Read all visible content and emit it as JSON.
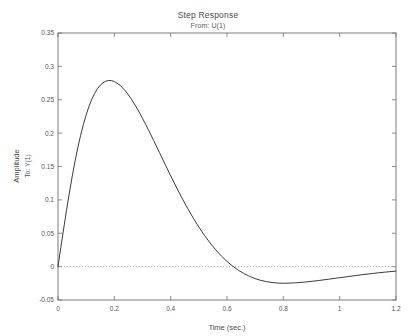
{
  "figure": {
    "title": "Step Response",
    "subtitle": "From: U(1)",
    "background_color": "#ffffff",
    "curve_color": "#3b3b3b",
    "axis_color": "#6f6f6f",
    "zero_line_color": "#9a9a9a"
  },
  "axes": {
    "xlabel": "Time (sec.)",
    "ylabel": "Amplitude",
    "ylabel_sub": "To: Y(1)"
  },
  "chart_data": {
    "type": "line",
    "title": "Step Response",
    "subtitle": "From: U(1)",
    "xlabel": "Time (sec.)",
    "ylabel": "Amplitude",
    "ylabel_sub": "To: Y(1)",
    "xlim": [
      0,
      1.2
    ],
    "ylim": [
      -0.05,
      0.35
    ],
    "xticks": [
      0,
      0.2,
      0.4,
      0.6,
      0.8,
      1,
      1.2
    ],
    "xtick_labels": [
      "0",
      "0.2",
      "0.4",
      "0.6",
      "0.8",
      "1",
      "1.2"
    ],
    "yticks": [
      -0.05,
      0,
      0.05,
      0.1,
      0.15,
      0.2,
      0.25,
      0.3,
      0.35
    ],
    "ytick_labels": [
      "-0.05",
      "0",
      "0.05",
      "0.1",
      "0.15",
      "0.2",
      "0.25",
      "0.3",
      "0.35"
    ],
    "grid": false,
    "legend": null,
    "zero_reference_line": 0,
    "annotations": {
      "peak_time": 0.165,
      "peak_amplitude": 0.325,
      "zero_crossing_time": 0.63,
      "undershoot_time": 0.78,
      "undershoot_amplitude": -0.018,
      "final_value": -0.003
    },
    "series": [
      {
        "name": "Y(1) from U(1)",
        "x": [
          0,
          0.01,
          0.02,
          0.03,
          0.04,
          0.05,
          0.06,
          0.07,
          0.08,
          0.09,
          0.1,
          0.11,
          0.12,
          0.13,
          0.14,
          0.15,
          0.16,
          0.17,
          0.18,
          0.19,
          0.2,
          0.22,
          0.24,
          0.26,
          0.28,
          0.3,
          0.32,
          0.34,
          0.36,
          0.38,
          0.4,
          0.42,
          0.44,
          0.46,
          0.48,
          0.5,
          0.52,
          0.54,
          0.56,
          0.58,
          0.6,
          0.62,
          0.64,
          0.66,
          0.68,
          0.7,
          0.72,
          0.74,
          0.76,
          0.78,
          0.8,
          0.84,
          0.88,
          0.92,
          0.96,
          1.0,
          1.04,
          1.08,
          1.12,
          1.16,
          1.2
        ],
        "y": [
          0,
          0.0285,
          0.0565,
          0.0838,
          0.1098,
          0.1342,
          0.1568,
          0.1775,
          0.1962,
          0.2129,
          0.2275,
          0.2401,
          0.2507,
          0.2595,
          0.2665,
          0.2718,
          0.2756,
          0.2779,
          0.2789,
          0.2787,
          0.2774,
          0.2718,
          0.2629,
          0.2513,
          0.2376,
          0.2223,
          0.2058,
          0.1886,
          0.1711,
          0.1535,
          0.1361,
          0.1192,
          0.1029,
          0.0874,
          0.0729,
          0.0593,
          0.0468,
          0.0354,
          0.0251,
          0.0159,
          0.0078,
          0.0007,
          -0.0053,
          -0.0104,
          -0.0146,
          -0.018,
          -0.0206,
          -0.0225,
          -0.0238,
          -0.0246,
          -0.0249,
          -0.0244,
          -0.023,
          -0.0211,
          -0.0189,
          -0.0166,
          -0.0143,
          -0.0121,
          -0.0101,
          -0.0083,
          -0.0067
        ]
      }
    ]
  }
}
